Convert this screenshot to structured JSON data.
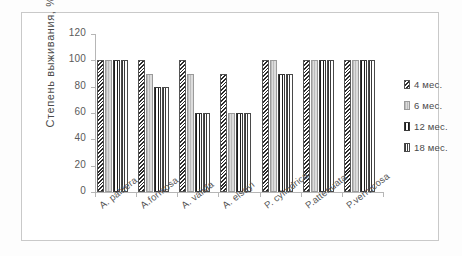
{
  "chart_data": {
    "type": "bar",
    "title": "",
    "xlabel": "",
    "ylabel": "Степень выживания, %",
    "ylim": [
      0,
      120
    ],
    "ytick_step": 20,
    "yticks": [
      "120",
      "100",
      "80",
      "60",
      "40",
      "20",
      "0"
    ],
    "grid": false,
    "legend_position": "right",
    "categories": [
      "A. palifera",
      "A.formosa",
      "A. valida",
      "A. elseyi",
      "P. cylindrica",
      "P.attenuata",
      "P.verrucosa"
    ],
    "series": [
      {
        "name": "4 мес.",
        "values": [
          100,
          100,
          100,
          90,
          100,
          100,
          100
        ]
      },
      {
        "name": "6 мес.",
        "values": [
          100,
          90,
          90,
          60,
          100,
          100,
          100
        ]
      },
      {
        "name": "12 мес.",
        "values": [
          100,
          80,
          60,
          60,
          90,
          100,
          100
        ]
      },
      {
        "name": "18 мес.",
        "values": [
          100,
          80,
          60,
          60,
          90,
          100,
          100
        ]
      }
    ]
  },
  "legend": {
    "items": [
      {
        "label": "4 мес."
      },
      {
        "label": "6 мес."
      },
      {
        "label": "12 мес."
      },
      {
        "label": "18 мес."
      }
    ]
  },
  "colors": {
    "axis": "#b6b6b6",
    "text": "#4a4a4a",
    "frame": "#c9c9c9",
    "background": "#ffffff"
  }
}
